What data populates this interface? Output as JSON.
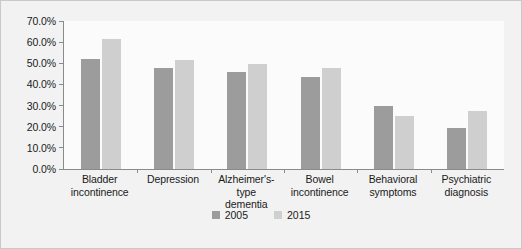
{
  "chart_data": {
    "type": "bar",
    "title": "",
    "subtitle": "",
    "xlabel": "",
    "ylabel": "",
    "ylim": [
      0,
      70
    ],
    "grid": false,
    "legend_position": "bottom",
    "ytick_labels": [
      "70.0%",
      "60.0%",
      "50.0%",
      "40.0%",
      "30.0%",
      "20.0%",
      "10.0%",
      "0.0%"
    ],
    "ytick_values": [
      70,
      60,
      50,
      40,
      30,
      20,
      10,
      0
    ],
    "categories": [
      "Bladder incontinence",
      "Depression",
      "Alzheimer's-type dementia",
      "Bowel incontinence",
      "Behavioral symptoms",
      "Psychiatric diagnosis"
    ],
    "category_lines": [
      [
        "Bladder",
        "incontinence"
      ],
      [
        "Depression"
      ],
      [
        "Alzheimer's-type",
        "dementia"
      ],
      [
        "Bowel",
        "incontinence"
      ],
      [
        "Behavioral",
        "symptoms"
      ],
      [
        "Psychiatric",
        "diagnosis"
      ]
    ],
    "series": [
      {
        "name": "2005",
        "color": "#9c9c9c",
        "values": [
          52.0,
          48.0,
          46.0,
          43.5,
          30.0,
          19.5
        ]
      },
      {
        "name": "2015",
        "color": "#cfcfcf",
        "values": [
          61.5,
          51.5,
          49.5,
          48.0,
          25.0,
          27.5
        ]
      }
    ]
  },
  "legend": {
    "items": [
      {
        "label": "2005",
        "color": "#9c9c9c"
      },
      {
        "label": "2015",
        "color": "#cfcfcf"
      }
    ]
  },
  "colors": {
    "card_background": "#f2f2f2",
    "card_border": "#c9c9c9",
    "plot_background": "#fbfbfb",
    "axis_line": "#8a8a8a",
    "text": "#1a1a1a",
    "series_2005": "#9c9c9c",
    "series_2015": "#cfcfcf"
  }
}
